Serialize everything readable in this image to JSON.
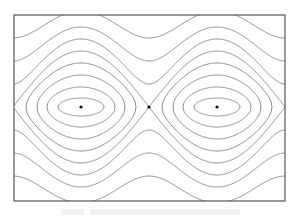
{
  "figure": {
    "frame": {
      "x": 14,
      "y": 15,
      "width": 271,
      "height": 186,
      "stroke": "#555555"
    },
    "curve_color": "#8c8c8c",
    "point_color": "#111111",
    "axis_y": 107,
    "centers_x": [
      81,
      217
    ],
    "saddles_x": [
      14,
      149,
      285
    ],
    "period_px": 136,
    "closed_orbits": [
      {
        "half_width": 23,
        "half_height": 9
      },
      {
        "half_width": 34,
        "half_height": 20
      },
      {
        "half_width": 44,
        "half_height": 32
      },
      {
        "half_width": 55,
        "half_height": 44
      }
    ],
    "separatrix": {
      "amplitude_at_center": 56
    },
    "open_orbits": [
      {
        "offset_at_saddle": 23,
        "offset_at_center": 68
      },
      {
        "offset_at_saddle": 46,
        "offset_at_center": 80
      },
      {
        "offset_at_saddle": 69,
        "offset_at_center": 96
      }
    ],
    "fixed_points": [
      {
        "type": "center",
        "x": 81,
        "y": 107
      },
      {
        "type": "saddle",
        "x": 149,
        "y": 107
      },
      {
        "type": "center",
        "x": 217,
        "y": 107
      }
    ]
  },
  "caption": {
    "text": ""
  }
}
